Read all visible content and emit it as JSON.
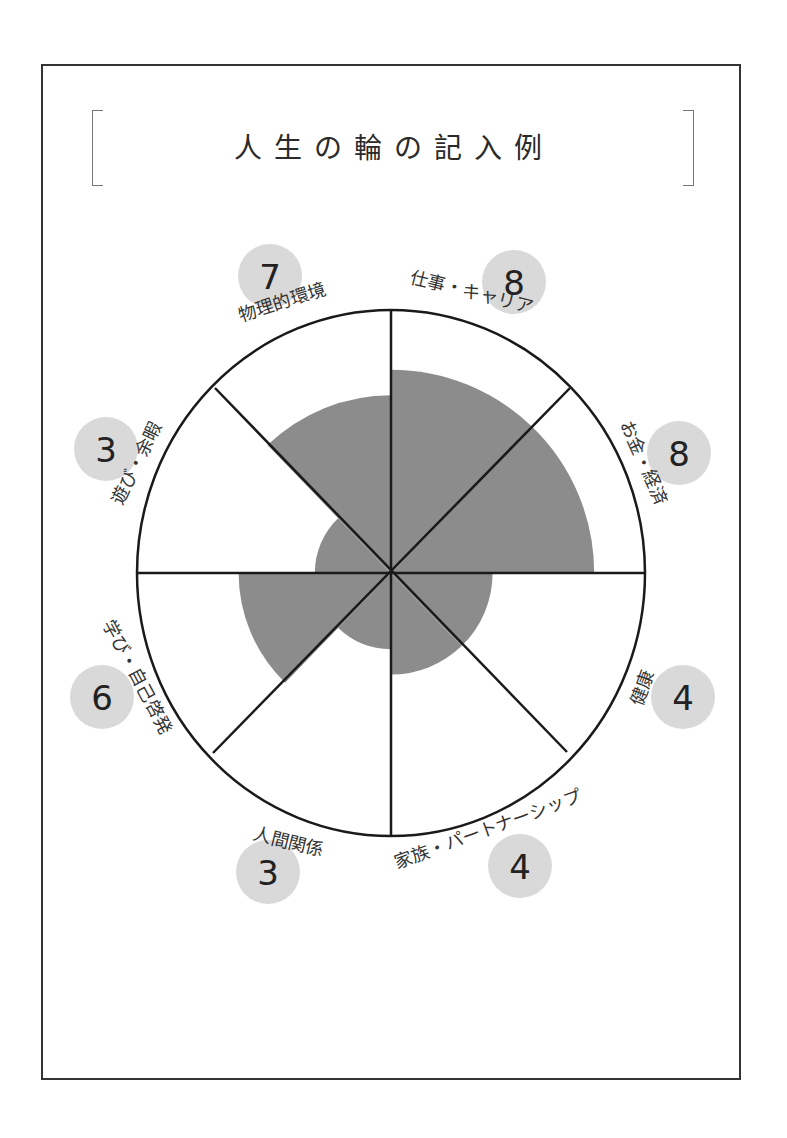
{
  "title": "人生の輪の記入例",
  "colors": {
    "frame": "#333333",
    "fill": "#8c8c8c",
    "badge": "#d9d9d9",
    "line": "#1a1a1a"
  },
  "wheel": {
    "center": [
      391,
      573
    ],
    "radius": 254,
    "max_score": 10
  },
  "chart_data": {
    "type": "polar-area",
    "title": "人生の輪の記入例",
    "max": 10,
    "categories": [
      "仕事・キャリア",
      "お金・経済",
      "健康",
      "家族・パートナーシップ",
      "人間関係",
      "学び・自己啓発",
      "遊び・余暇",
      "物理的環境"
    ],
    "values": [
      8,
      8,
      4,
      4,
      3,
      6,
      3,
      7
    ]
  },
  "segments": [
    {
      "label": "仕事・キャリア",
      "score": "8"
    },
    {
      "label": "お金・経済",
      "score": "8"
    },
    {
      "label": "健康",
      "score": "4"
    },
    {
      "label": "家族・パートナーシップ",
      "score": "4"
    },
    {
      "label": "人間関係",
      "score": "3"
    },
    {
      "label": "学び・自己啓発",
      "score": "6"
    },
    {
      "label": "遊び・余暇",
      "score": "3"
    },
    {
      "label": "物理的環境",
      "score": "7"
    }
  ]
}
